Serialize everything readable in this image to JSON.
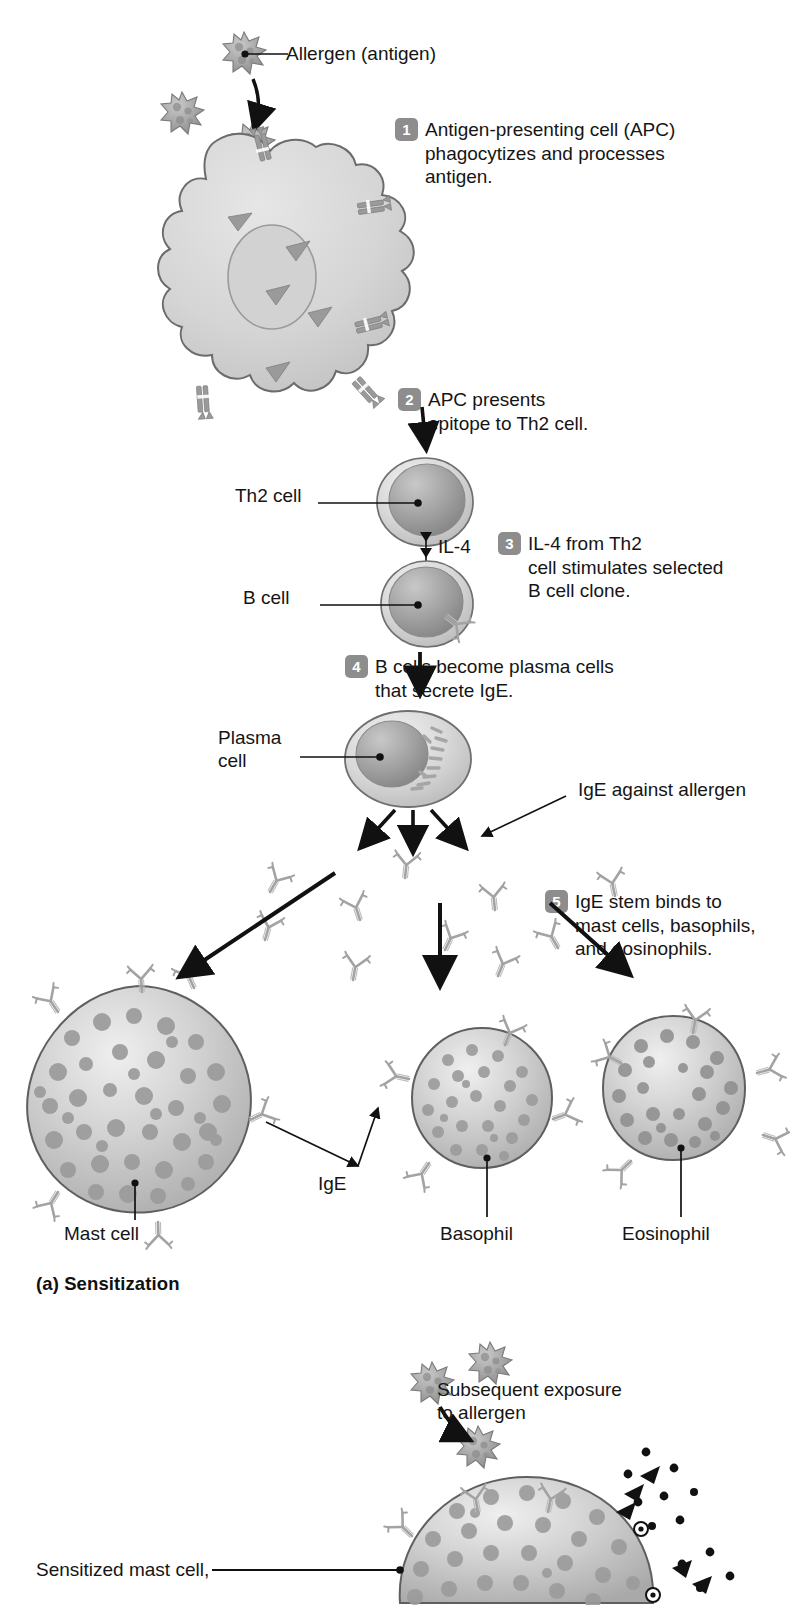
{
  "figure": {
    "title_a": "(a) Sensitization",
    "topic": "Type I hypersensitivity (allergy) mechanism"
  },
  "labels": {
    "allergen": "Allergen (antigen)",
    "th2_cell": "Th2 cell",
    "b_cell": "B cell",
    "il4": "IL-4",
    "plasma_cell": "Plasma\ncell",
    "ige_against_allergen": "IgE against allergen",
    "ige": "IgE",
    "mast_cell": "Mast cell",
    "basophil": "Basophil",
    "eosinophil": "Eosinophil",
    "subsequent_exposure": "Subsequent exposure\nto allergen",
    "sensitized_mast_cell": "Sensitized mast cell,"
  },
  "steps": [
    {
      "number": "1",
      "text": "Antigen-presenting cell (APC)\nphagocytizes and processes\nantigen."
    },
    {
      "number": "2",
      "text": "APC presents\nepitope to Th2 cell."
    },
    {
      "number": "3",
      "text": "IL-4 from Th2\ncell stimulates selected\nB cell clone."
    },
    {
      "number": "4",
      "text": "B cells become plasma cells\nthat secrete IgE."
    },
    {
      "number": "5",
      "text": "IgE stem binds to\nmast cells, basophils,\nand eosinophils."
    }
  ],
  "colors": {
    "badge_gray": "#8d8d8d",
    "cell_outline": "#6f6f6f",
    "cytoplasm_light": "#dcdcdc",
    "nucleus_mid": "#9a9a9a",
    "granule": "#8f8f8f",
    "antibody": "#a8a8a8",
    "allergen_body": "#a0a0a0",
    "arrow_black": "#111111",
    "text": "#151515"
  }
}
